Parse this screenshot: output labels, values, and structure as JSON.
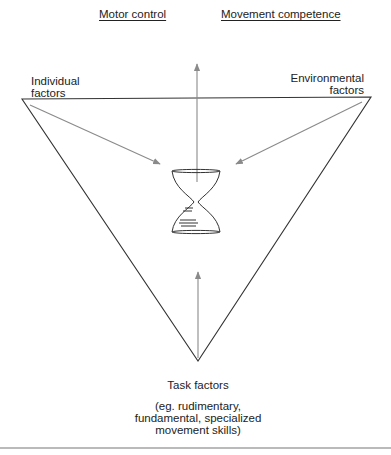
{
  "diagram": {
    "top_labels": [
      "Motor control",
      "Movement competence"
    ],
    "corners": {
      "left": [
        "Individual",
        "factors"
      ],
      "right": [
        "Environmental",
        "factors"
      ],
      "bottom": {
        "title": "Task factors",
        "note": [
          "(eg. rudimentary,",
          "fundamental, specialized",
          "movement skills)"
        ]
      }
    },
    "center_icon": "hourglass-icon",
    "colors": {
      "triangle": "#333333",
      "arrows": "#8a8a8a",
      "rule": "#777777"
    }
  }
}
